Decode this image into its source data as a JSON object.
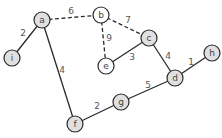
{
  "diagram": {
    "type": "weighted-undirected-graph",
    "node_radius": 8,
    "colors": {
      "gray_fill": "#e0e0e0",
      "white_fill": "#ffffff",
      "stroke": "#2a2a2a"
    },
    "nodes": [
      {
        "id": "a",
        "label": "a",
        "x": 42,
        "y": 20,
        "fill": "gray"
      },
      {
        "id": "b",
        "label": "b",
        "x": 101,
        "y": 15,
        "fill": "white"
      },
      {
        "id": "c",
        "label": "c",
        "x": 149,
        "y": 38,
        "fill": "gray"
      },
      {
        "id": "e",
        "label": "e",
        "x": 106,
        "y": 66,
        "fill": "white"
      },
      {
        "id": "i",
        "label": "i",
        "x": 12,
        "y": 58,
        "fill": "gray"
      },
      {
        "id": "h",
        "label": "h",
        "x": 212,
        "y": 53,
        "fill": "gray"
      },
      {
        "id": "d",
        "label": "d",
        "x": 175,
        "y": 78,
        "fill": "gray"
      },
      {
        "id": "g",
        "label": "g",
        "x": 121,
        "y": 102,
        "fill": "gray"
      },
      {
        "id": "f",
        "label": "f",
        "x": 75,
        "y": 124,
        "fill": "gray"
      }
    ],
    "edges": [
      {
        "from": "a",
        "to": "b",
        "weight": "6",
        "style": "dashed",
        "lx": 71,
        "ly": 11
      },
      {
        "from": "b",
        "to": "c",
        "weight": "7",
        "style": "dashed",
        "lx": 128,
        "ly": 20
      },
      {
        "from": "b",
        "to": "e",
        "weight": "9",
        "style": "dashed",
        "lx": 109,
        "ly": 38
      },
      {
        "from": "a",
        "to": "i",
        "weight": "2",
        "style": "solid",
        "lx": 23,
        "ly": 33
      },
      {
        "from": "a",
        "to": "f",
        "weight": "4",
        "style": "solid",
        "lx": 62,
        "ly": 70
      },
      {
        "from": "e",
        "to": "c",
        "weight": "3",
        "style": "solid",
        "lx": 132,
        "ly": 57
      },
      {
        "from": "c",
        "to": "d",
        "weight": "4",
        "style": "solid",
        "lx": 168,
        "ly": 56
      },
      {
        "from": "d",
        "to": "h",
        "weight": "1",
        "style": "solid",
        "lx": 191,
        "ly": 62
      },
      {
        "from": "g",
        "to": "d",
        "weight": "5",
        "style": "solid",
        "lx": 148,
        "ly": 85
      },
      {
        "from": "f",
        "to": "g",
        "weight": "2",
        "style": "solid",
        "lx": 97,
        "ly": 106
      }
    ]
  }
}
